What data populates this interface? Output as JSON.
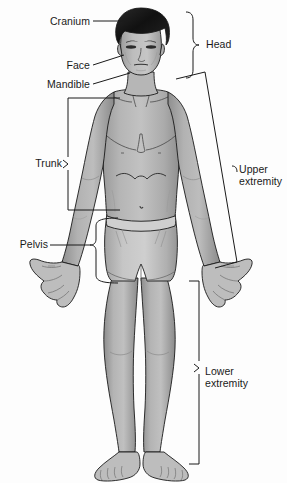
{
  "diagram": {
    "view": "anterior",
    "background_color": "#fdfdfd",
    "line_color": "#1a1a1a",
    "skin_fill": "#a8a8a8",
    "skin_fill_light": "#c4c4c4",
    "skin_shadow": "#8d8d8d",
    "hair_fill": "#1c1c1c",
    "shorts_fill": "#b9b9b9",
    "shorts_shadow": "#9a9a9a"
  },
  "labels": [
    {
      "id": "cranium",
      "text": "Cranium",
      "side": "left",
      "connector": "leader-line",
      "x": 30,
      "y": 16,
      "width": 60
    },
    {
      "id": "face",
      "text": "Face",
      "side": "left",
      "connector": "leader-line",
      "x": 30,
      "y": 60,
      "width": 60
    },
    {
      "id": "mandible",
      "text": "Mandible",
      "side": "left",
      "connector": "leader-line",
      "x": 22,
      "y": 79,
      "width": 68
    },
    {
      "id": "trunk",
      "text": "Trunk",
      "side": "left",
      "connector": "bracket",
      "x": 22,
      "y": 160,
      "width": 40
    },
    {
      "id": "pelvis",
      "text": "Pelvis",
      "side": "left",
      "connector": "brace",
      "x": 8,
      "y": 239,
      "width": 40
    },
    {
      "id": "head",
      "text": "Head",
      "side": "right",
      "connector": "brace",
      "x": 206,
      "y": 39,
      "width": 50
    },
    {
      "id": "upper_extremity",
      "text": "Upper\nextremity",
      "side": "right",
      "connector": "outline",
      "x": 239,
      "y": 164,
      "width": 48
    },
    {
      "id": "lower_extremity",
      "text": "Lower\nextremity",
      "side": "right",
      "connector": "bracket",
      "x": 205,
      "y": 366,
      "width": 55
    }
  ]
}
